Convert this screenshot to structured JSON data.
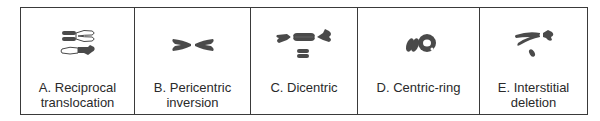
{
  "figure": {
    "panels": [
      {
        "id": "A",
        "label_line1": "A. Reciprocal",
        "label_line2": "translocation",
        "icon": "reciprocal-translocation-chromosomes-icon"
      },
      {
        "id": "B",
        "label_line1": "B. Pericentric",
        "label_line2": "inversion",
        "icon": "pericentric-inversion-chromosome-icon"
      },
      {
        "id": "C",
        "label_line1": "C. Dicentric",
        "label_line2": "",
        "icon": "dicentric-chromosome-icon"
      },
      {
        "id": "D",
        "label_line1": "D. Centric-ring",
        "label_line2": "",
        "icon": "centric-ring-chromosome-icon"
      },
      {
        "id": "E",
        "label_line1": "E. Interstitial",
        "label_line2": "deletion",
        "icon": "interstitial-deletion-chromosome-icon"
      }
    ],
    "colors": {
      "border": "#3a3a3a",
      "chromosome_fill": "#4a4a4a",
      "text": "#2a2a2a"
    }
  }
}
